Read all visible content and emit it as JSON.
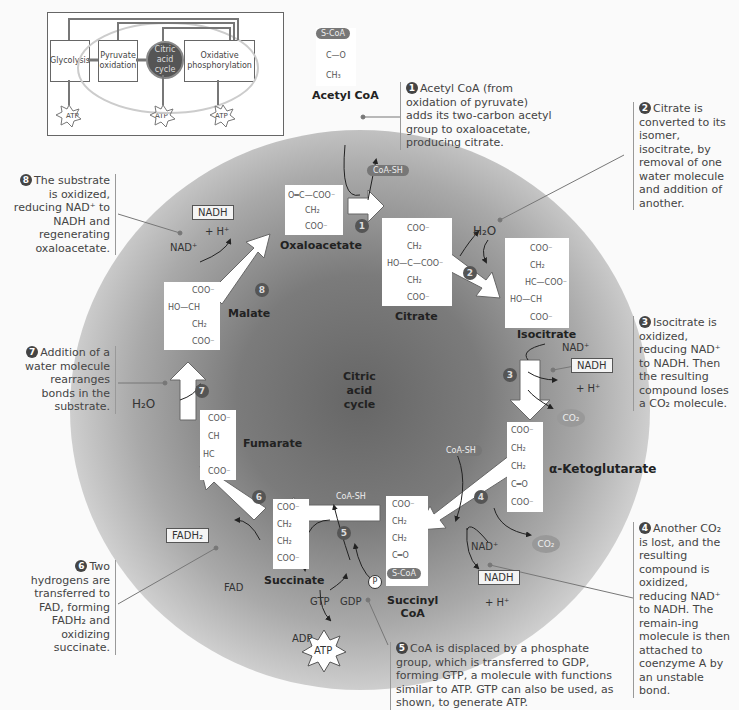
{
  "inset": {
    "glycolysis": "Glycolysis",
    "pyruvate_oxidation": "Pyruvate oxidation",
    "citric_acid_cycle": "Citric acid cycle",
    "oxidative_phosphorylation": "Oxidative phosphorylation",
    "atp": [
      "ATP",
      "ATP",
      "ATP"
    ]
  },
  "center_label": [
    "Citric",
    "acid",
    "cycle"
  ],
  "molecules": {
    "acetyl_coa": {
      "name": "Acetyl CoA",
      "lines": [
        "S-CoA",
        "C—O",
        "CH₃"
      ]
    },
    "oxaloacetate": {
      "name": "Oxaloacetate",
      "lines": [
        "O═C—COO⁻",
        "CH₂",
        "COO⁻"
      ]
    },
    "citrate": {
      "name": "Citrate",
      "lines": [
        "COO⁻",
        "CH₂",
        "HO—C—COO⁻",
        "CH₂",
        "COO⁻"
      ]
    },
    "isocitrate": {
      "name": "Isocitrate",
      "lines": [
        "COO⁻",
        "CH₂",
        "HC—COO⁻",
        "HO—CH",
        "COO⁻"
      ]
    },
    "alpha_ketoglutarate": {
      "name": "α-Ketoglutarate",
      "lines": [
        "COO⁻",
        "CH₂",
        "CH₂",
        "C═O",
        "COO⁻"
      ]
    },
    "succinyl_coa": {
      "name": "Succinyl CoA",
      "name_line1": "Succinyl",
      "name_line2": "CoA",
      "lines": [
        "COO⁻",
        "CH₂",
        "CH₂",
        "C═O",
        "S-CoA"
      ]
    },
    "succinate": {
      "name": "Succinate",
      "lines": [
        "COO⁻",
        "CH₂",
        "CH₂",
        "COO⁻"
      ]
    },
    "fumarate": {
      "name": "Fumarate",
      "lines": [
        "COO⁻",
        "CH",
        "HC",
        "COO⁻"
      ]
    },
    "malate": {
      "name": "Malate",
      "lines": [
        "COO⁻",
        "HO—CH",
        "CH₂",
        "COO⁻"
      ]
    }
  },
  "steps": [
    "1",
    "2",
    "3",
    "4",
    "5",
    "6",
    "7",
    "8"
  ],
  "labels": {
    "coa_sh": "CoA-SH",
    "h2o": "H₂O",
    "nad_plus": "NAD⁺",
    "nadh": "NADH",
    "h_plus": "+ H⁺",
    "co2": "CO₂",
    "fad": "FAD",
    "fadh2": "FADH₂",
    "gtp": "GTP",
    "gdp": "GDP",
    "adp": "ADP",
    "atp": "ATP",
    "pi": "P"
  },
  "notes": {
    "n1": {
      "num": "1",
      "text": "Acetyl CoA (from oxidation of pyruvate) adds its two-carbon acetyl group to oxaloacetate, producing citrate."
    },
    "n2": {
      "num": "2",
      "text": "Citrate is converted to its isomer, isocitrate, by removal of one water molecule and addition of another."
    },
    "n3": {
      "num": "3",
      "text": "Isocitrate is oxidized, reducing NAD⁺ to NADH. Then the resulting compound loses a CO₂ molecule."
    },
    "n4": {
      "num": "4",
      "text": "Another CO₂ is lost, and the resulting compound is oxidized, reducing NAD⁺ to NADH. The remain-ing molecule is then attached to coenzyme A by an unstable bond."
    },
    "n5": {
      "num": "5",
      "text": "CoA is displaced by a phosphate group, which is transferred to GDP, forming GTP, a molecule with functions similar to ATP. GTP can also be used, as shown, to generate ATP."
    },
    "n6": {
      "num": "6",
      "text": "Two hydrogens are transferred to FAD, forming FADH₂ and oxidizing succinate."
    },
    "n7": {
      "num": "7",
      "text": "Addition of a water molecule rearranges bonds in the substrate."
    },
    "n8": {
      "num": "8",
      "text": "The substrate is oxidized, reducing NAD⁺ to NADH and regenerating oxaloacetate."
    }
  }
}
